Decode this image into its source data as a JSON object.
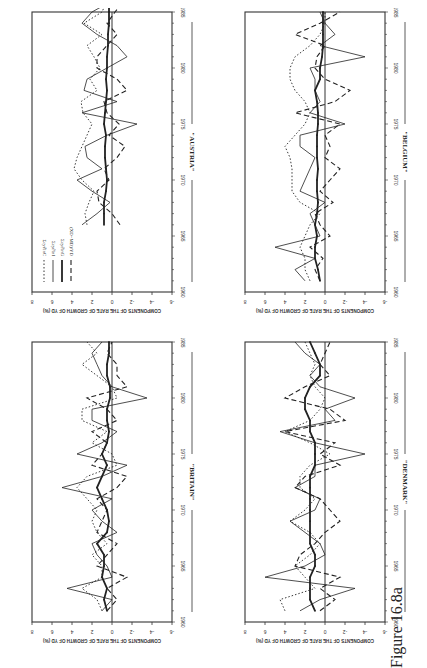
{
  "figure": {
    "caption": "Figure 16.8a",
    "orientation": "rotated 90° (landscape on portrait page)"
  },
  "legend": [
    {
      "label": "Σcy∂lnC",
      "style": "dotted",
      "series": "consumption"
    },
    {
      "label": "Σcy∂lnI",
      "style": "thin-solid",
      "series": "investment"
    },
    {
      "label": "Σcy∂lnG",
      "style": "thick-solid-markers",
      "series": "government"
    },
    {
      "label": "(XD−MD)/YD",
      "style": "dashed",
      "series": "net_exports"
    }
  ],
  "chart_data": [
    {
      "type": "line",
      "title": "\"AUSTRIA\"",
      "xlabel": "",
      "ylabel": "COMPONENTS OF THE RATE OF GROWTH OF YD (%)",
      "xlim": [
        1960,
        1985
      ],
      "ylim": [
        -6,
        8
      ],
      "x_ticks": [
        "1960",
        "1965",
        "1970",
        "1975",
        "1980",
        "1985"
      ],
      "y_ticks": [
        "8",
        "6",
        "4",
        "2",
        "0",
        "-2",
        "-4",
        "-6"
      ],
      "x": [
        1966,
        1967,
        1968,
        1969,
        1970,
        1971,
        1972,
        1973,
        1974,
        1975,
        1976,
        1977,
        1978,
        1979,
        1980,
        1981,
        1982,
        1983,
        1984,
        1985,
        1986
      ],
      "series": [
        {
          "name": "Σcy∂lnC",
          "values": [
            2.5,
            2.7,
            2.3,
            1.8,
            3.0,
            3.8,
            3.5,
            3.0,
            2.5,
            2.0,
            2.9,
            3.1,
            1.5,
            2.2,
            1.2,
            1.8,
            2.5,
            1.0,
            2.8,
            1.0,
            0.5
          ]
        },
        {
          "name": "Σcy∂lnI",
          "values": [
            3.0,
            1.5,
            0.2,
            2.0,
            3.5,
            1.0,
            2.5,
            2.7,
            0.5,
            -2.5,
            3.0,
            -0.5,
            2.8,
            2.5,
            0.5,
            -1.5,
            -0.5,
            1.5,
            3.0,
            2.0,
            0
          ]
        },
        {
          "name": "Σcy∂lnG",
          "values": [
            0.8,
            0.8,
            0.8,
            0.6,
            0.5,
            0.6,
            0.7,
            0.7,
            0.6,
            0.8,
            0.7,
            0.6,
            0.5,
            0.6,
            0.5,
            0.5,
            0.4,
            0.4,
            0.3,
            0.3,
            0.3
          ]
        },
        {
          "name": "(XD−MD)/YD",
          "values": [
            -0.8,
            0,
            1.3,
            1.5,
            0.3,
            0.8,
            -0.5,
            -1.3,
            0.3,
            -0.7,
            0.5,
            0.8,
            -1.5,
            -0.5,
            1.5,
            1.5,
            0.5,
            -0.5,
            0.5,
            -0.3,
            -1.2
          ]
        }
      ],
      "legend_position": "upper-left",
      "grid": false
    },
    {
      "type": "line",
      "title": "\"BELGIUM\"",
      "ylabel": "COMPONENTS OF THE RATE OF GROWTH OF YD (%)",
      "xlim": [
        1960,
        1985
      ],
      "ylim": [
        -6,
        8
      ],
      "x_ticks": [
        "1960",
        "1965",
        "1970",
        "1975",
        "1980",
        "1985"
      ],
      "y_ticks": [
        "8",
        "6",
        "4",
        "2",
        "0",
        "-2",
        "-4",
        "-6"
      ],
      "x": [
        1961,
        1962,
        1963,
        1964,
        1965,
        1966,
        1967,
        1968,
        1969,
        1970,
        1971,
        1972,
        1973,
        1974,
        1975,
        1976,
        1977,
        1978,
        1979,
        1980,
        1981,
        1982,
        1983,
        1984,
        1985
      ],
      "series": [
        {
          "name": "Σcy∂lnC",
          "values": [
            1.5,
            2.0,
            2.0,
            2.5,
            2.0,
            1.5,
            0.5,
            2.5,
            3.3,
            3.3,
            3.3,
            3.5,
            4.0,
            3.0,
            2.0,
            1.5,
            2.0,
            3.0,
            3.5,
            3.5,
            3.0,
            1.5,
            0.5,
            0,
            0
          ]
        },
        {
          "name": "Σcy∂lnI",
          "values": [
            2.0,
            3.0,
            1.0,
            5.0,
            0.5,
            1.0,
            1.5,
            0,
            2.5,
            2.0,
            1.5,
            1.0,
            2.5,
            2.5,
            -2.0,
            1.5,
            0.5,
            1.0,
            1.0,
            1.5,
            -4.0,
            0.5,
            -1.0,
            0,
            0.5
          ]
        },
        {
          "name": "Σcy∂lnG",
          "values": [
            0.5,
            0.7,
            1.0,
            1.0,
            0.8,
            1.0,
            0.8,
            0.7,
            0.8,
            0.8,
            0.7,
            0.8,
            0.8,
            0.8,
            0.7,
            0.7,
            0.8,
            1.0,
            0.5,
            0.5,
            0.3,
            0.2,
            0.2,
            0.2,
            0.2
          ]
        },
        {
          "name": "(XD−MD)/YD",
          "values": [
            0.5,
            1.0,
            0.2,
            1.5,
            -0.5,
            0.5,
            1.0,
            -0.8,
            0.5,
            -0.5,
            -1.5,
            0,
            -0.5,
            0,
            -1.5,
            3.0,
            -1.0,
            -2.5,
            0,
            1.0,
            0.8,
            0,
            3.0,
            0.5,
            -1.5
          ]
        }
      ],
      "grid": false
    },
    {
      "type": "line",
      "title": "\"BRITAIN\"",
      "ylabel": "COMPONENTS OF THE RATE OF GROWTH OF YD (%)",
      "xlim": [
        1960,
        1985
      ],
      "ylim": [
        -6,
        8
      ],
      "x_ticks": [
        "1960",
        "1965",
        "1970",
        "1975",
        "1980",
        "1985"
      ],
      "y_ticks": [
        "8",
        "6",
        "4",
        "2",
        "0",
        "-2",
        "-4",
        "-6"
      ],
      "x": [
        1961,
        1962,
        1963,
        1964,
        1965,
        1966,
        1967,
        1968,
        1969,
        1970,
        1971,
        1972,
        1973,
        1974,
        1975,
        1976,
        1977,
        1978,
        1979,
        1980,
        1981,
        1982,
        1983,
        1984,
        1985
      ],
      "series": [
        {
          "name": "Σcy∂lnC",
          "values": [
            1.0,
            1.5,
            3.0,
            1.0,
            1.0,
            2.0,
            0.5,
            1.5,
            2.0,
            1.5,
            2.5,
            3.5,
            2.5,
            -0.5,
            0,
            2.0,
            0.5,
            3.0,
            3.0,
            -0.5,
            0,
            1.5,
            3.0,
            1.5,
            2.5
          ]
        },
        {
          "name": "Σcy∂lnI",
          "values": [
            1.0,
            0,
            4.5,
            0,
            0.5,
            1.5,
            2.0,
            -0.5,
            1.0,
            2.0,
            0,
            5.0,
            1.0,
            -1.5,
            3.5,
            1.0,
            -0.5,
            2.0,
            2.0,
            -3.5,
            0,
            1.0,
            1.5,
            2.0,
            1.0
          ]
        },
        {
          "name": "Σcy∂lnG",
          "values": [
            0.5,
            0.8,
            0.5,
            1.0,
            0.8,
            0.8,
            1.5,
            0.5,
            0.3,
            0.5,
            1.0,
            1.5,
            1.0,
            0.5,
            1.0,
            0.5,
            0.3,
            0.5,
            0.5,
            0.2,
            0.2,
            0.5,
            0.5,
            0.3,
            0.3
          ]
        },
        {
          "name": "(XD−MD)/YD",
          "values": [
            0.5,
            -0.5,
            0.5,
            -1.5,
            1.5,
            0.5,
            -0.5,
            1.5,
            1.0,
            0.5,
            1.5,
            -0.5,
            -1.5,
            2.0,
            1.0,
            0.5,
            2.0,
            -0.5,
            0.5,
            2.5,
            -1.5,
            -0.5,
            -0.5,
            0.5,
            0
          ]
        }
      ],
      "grid": false
    },
    {
      "type": "line",
      "title": "\"DENMARK\"",
      "ylabel": "COMPONENTS OF THE RATE OF GROWTH OF YD (%)",
      "xlim": [
        1960,
        1985
      ],
      "ylim": [
        -6,
        8
      ],
      "x_ticks": [
        "1960",
        "1965",
        "1970",
        "1975",
        "1980",
        "1985"
      ],
      "y_ticks": [
        "8",
        "6",
        "4",
        "2",
        "0",
        "-2",
        "-4",
        "-6"
      ],
      "x": [
        1961,
        1962,
        1963,
        1964,
        1965,
        1966,
        1967,
        1968,
        1969,
        1970,
        1971,
        1972,
        1973,
        1974,
        1975,
        1976,
        1977,
        1978,
        1979,
        1980,
        1981,
        1982,
        1983,
        1984,
        1985
      ],
      "series": [
        {
          "name": "Σcy∂lnC",
          "values": [
            4.0,
            4.5,
            1.0,
            2.0,
            3.0,
            1.5,
            0.5,
            1.5,
            3.5,
            2.0,
            1.0,
            2.5,
            2.5,
            1.5,
            -0.5,
            1.5,
            4.0,
            1.5,
            0.5,
            0,
            1.0,
            1.5,
            1.0,
            1.5,
            2.0
          ]
        },
        {
          "name": "Σcy∂lnI",
          "values": [
            2.5,
            0.5,
            -3.0,
            6.0,
            2.0,
            0,
            0.5,
            2.0,
            3.5,
            1.0,
            0.5,
            3.0,
            1.0,
            1.0,
            -4.0,
            1.0,
            4.5,
            -1.0,
            0,
            -3.0,
            0.5,
            1.5,
            0.5,
            2.0,
            3.0
          ]
        },
        {
          "name": "Σcy∂lnG",
          "values": [
            1.0,
            1.5,
            1.5,
            1.5,
            1.0,
            1.0,
            1.5,
            1.5,
            1.5,
            1.5,
            1.5,
            1.5,
            1.5,
            1.0,
            1.0,
            1.0,
            1.5,
            1.5,
            2.0,
            2.0,
            1.5,
            0.5,
            0.5,
            1.0,
            1.5
          ]
        },
        {
          "name": "(XD−MD)/YD",
          "values": [
            0.5,
            -1.0,
            0.5,
            -1.5,
            3.0,
            2.5,
            1.0,
            0,
            -1.5,
            -0.5,
            0.5,
            3.0,
            2.0,
            -1.5,
            0.5,
            -1.0,
            4.0,
            -2.0,
            -0.5,
            4.0,
            2.0,
            -0.5,
            0.5,
            0,
            -0.5
          ]
        }
      ],
      "grid": false
    }
  ]
}
